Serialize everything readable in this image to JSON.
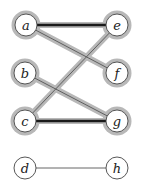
{
  "graph": {
    "colors": {
      "halo": "#b8b8b8",
      "edge_thick": "#1a1a1a",
      "edge_thin": "#555555",
      "node_fill": "#ffffff",
      "node_stroke": "#444444"
    },
    "nodes": [
      {
        "id": "a",
        "label": "a",
        "x": 26,
        "y": 25,
        "highlighted": true
      },
      {
        "id": "b",
        "label": "b",
        "x": 25,
        "y": 73,
        "highlighted": true
      },
      {
        "id": "c",
        "label": "c",
        "x": 25,
        "y": 121,
        "highlighted": true
      },
      {
        "id": "d",
        "label": "d",
        "x": 25,
        "y": 168,
        "highlighted": false
      },
      {
        "id": "e",
        "label": "e",
        "x": 117,
        "y": 25,
        "highlighted": true
      },
      {
        "id": "f",
        "label": "f",
        "x": 117,
        "y": 73,
        "highlighted": true
      },
      {
        "id": "g",
        "label": "g",
        "x": 117,
        "y": 121,
        "highlighted": true
      },
      {
        "id": "h",
        "label": "h",
        "x": 117,
        "y": 168,
        "highlighted": false
      }
    ],
    "edges": [
      {
        "from": "a",
        "to": "e",
        "style": "thick",
        "highlighted": true
      },
      {
        "from": "a",
        "to": "f",
        "style": "thin",
        "highlighted": true
      },
      {
        "from": "e",
        "to": "c",
        "style": "thin",
        "highlighted": true
      },
      {
        "from": "b",
        "to": "g",
        "style": "thin",
        "highlighted": true
      },
      {
        "from": "c",
        "to": "g",
        "style": "thick",
        "highlighted": true
      },
      {
        "from": "d",
        "to": "h",
        "style": "thin",
        "highlighted": false
      }
    ]
  }
}
